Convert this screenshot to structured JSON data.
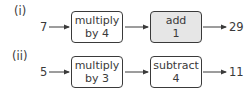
{
  "rows": [
    {
      "label": "(i)",
      "input": "7",
      "steps": [
        {
          "line1": "multiply",
          "line2": "by 4",
          "shaded": false
        },
        {
          "line1": "add",
          "line2": "1",
          "shaded": true
        }
      ],
      "output": "29"
    },
    {
      "label": "(ii)",
      "input": "5",
      "steps": [
        {
          "line1": "multiply",
          "line2": "by 3",
          "shaded": false
        },
        {
          "line1": "subtract",
          "line2": "4",
          "shaded": false
        }
      ],
      "output": "11"
    }
  ],
  "colors": {
    "stroke": "#3a3a3a",
    "shaded_fill": "#e6e6e6"
  }
}
